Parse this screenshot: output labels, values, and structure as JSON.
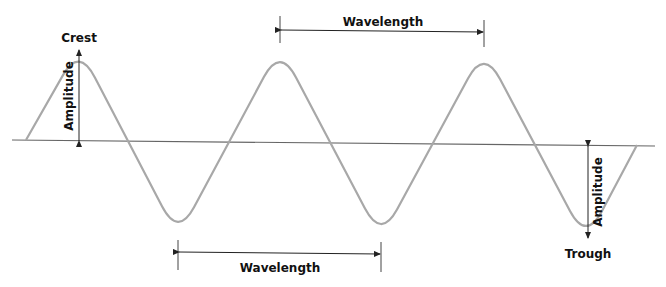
{
  "diagram": {
    "type": "transverse-wave",
    "labels": {
      "crest": "Crest",
      "trough": "Trough",
      "amplitude_left": "Amplitude",
      "amplitude_right": "Amplitude",
      "wavelength_top": "Wavelength",
      "wavelength_bottom": "Wavelength"
    },
    "colors": {
      "wave": "#a8a8a8",
      "axis": "#666666",
      "annotation": "#222222",
      "text": "#111111"
    },
    "wave": {
      "cycles_shown": 3,
      "crests": 3,
      "troughs": 3
    }
  }
}
